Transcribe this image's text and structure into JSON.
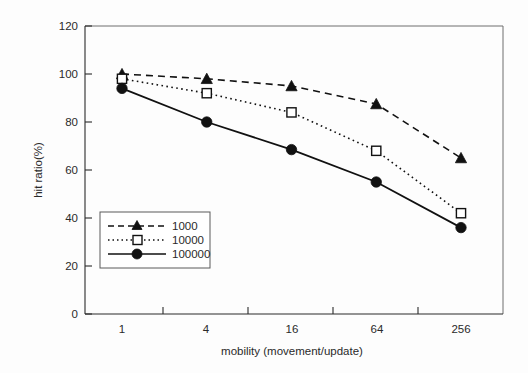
{
  "chart_data": {
    "type": "line",
    "title": "",
    "xlabel": "mobility (movement/update)",
    "ylabel": "hit ratio(%)",
    "categories": [
      "1",
      "4",
      "16",
      "64",
      "256"
    ],
    "xtick_labels": [
      "1",
      "4",
      "16",
      "64",
      "256"
    ],
    "ytick_labels": [
      "0",
      "20",
      "40",
      "60",
      "80",
      "100",
      "120"
    ],
    "ylim": [
      0,
      120
    ],
    "ytick_step": 20,
    "grid": false,
    "legend_position": "lower-left-inside",
    "series": [
      {
        "name": "1000",
        "values": [
          100,
          98,
          95,
          87.5,
          65
        ],
        "marker": "triangle-filled",
        "line_style": "dashed",
        "color": "#111111"
      },
      {
        "name": "10000",
        "values": [
          98,
          92,
          84,
          68,
          42
        ],
        "marker": "square-open",
        "line_style": "dotted",
        "color": "#111111"
      },
      {
        "name": "100000",
        "values": [
          94,
          80,
          68.5,
          55,
          36
        ],
        "marker": "circle-filled",
        "line_style": "solid",
        "color": "#111111"
      }
    ]
  },
  "legend": {
    "entries": [
      {
        "label": "1000"
      },
      {
        "label": "10000"
      },
      {
        "label": "100000"
      }
    ]
  },
  "colors": {
    "ink": "#111111",
    "frame": "#6f6f6f",
    "background": "#fdfdfd"
  }
}
